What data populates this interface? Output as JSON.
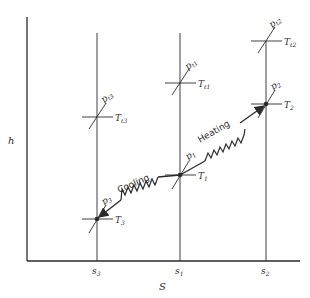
{
  "diagram": {
    "axes": {
      "x_label": "S",
      "y_label": "h",
      "x_ticks": [
        "s3",
        "s1",
        "s2"
      ]
    },
    "states": [
      {
        "id": "1",
        "p_label": "p1",
        "t_label": "T1"
      },
      {
        "id": "2",
        "p_label": "p2",
        "t_label": "T2"
      },
      {
        "id": "3",
        "p_label": "p3",
        "t_label": "T3"
      }
    ],
    "stagnation_states": [
      {
        "id": "t1",
        "p_label": "pt1",
        "t_label": "Tt1"
      },
      {
        "id": "t2",
        "p_label": "pt2",
        "t_label": "Tt2"
      },
      {
        "id": "t3",
        "p_label": "pt3",
        "t_label": "Tt3"
      }
    ],
    "processes": [
      {
        "from": "1",
        "to": "2",
        "label": "Heating"
      },
      {
        "from": "1",
        "to": "3",
        "label": "Cooling"
      }
    ],
    "colors": {
      "line": "#2a2a2a",
      "background": "#ffffff"
    }
  }
}
